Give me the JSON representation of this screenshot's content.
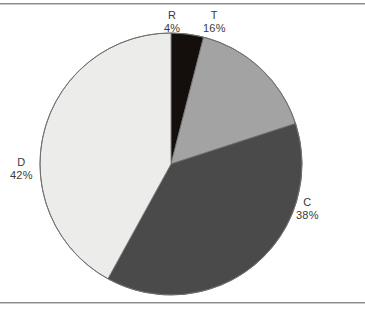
{
  "figure": {
    "name": "pie-chart-figure",
    "width": 365,
    "height": 317,
    "background_color": "#ffffff",
    "rule_color": "#8a8a8a"
  },
  "chart_data": {
    "type": "pie",
    "title": "",
    "subtitle": "",
    "xlabel": "",
    "ylabel": "",
    "legend_position": "none",
    "grid": false,
    "labels_inside": false,
    "label_format": "name_over_percent",
    "start_angle_deg": 0,
    "direction": "clockwise",
    "categories": [
      "R",
      "T",
      "C",
      "D"
    ],
    "values": [
      4,
      16,
      38,
      42
    ],
    "value_labels": [
      "4%",
      "16%",
      "38%",
      "42%"
    ],
    "colors": [
      "#140f0d",
      "#a3a3a3",
      "#4a4a4a",
      "#ececea"
    ],
    "slices": [
      {
        "name": "R",
        "label": "R",
        "percent": 4,
        "percent_label": "4%",
        "color": "#140f0d",
        "start_deg": 0,
        "end_deg": 14.4,
        "label_anchor": "top"
      },
      {
        "name": "T",
        "label": "T",
        "percent": 16,
        "percent_label": "16%",
        "color": "#a3a3a3",
        "start_deg": 14.4,
        "end_deg": 72,
        "label_anchor": "top-right"
      },
      {
        "name": "C",
        "label": "C",
        "percent": 38,
        "percent_label": "38%",
        "color": "#4a4a4a",
        "start_deg": 72,
        "end_deg": 208.8,
        "label_anchor": "right"
      },
      {
        "name": "D",
        "label": "D",
        "percent": 42,
        "percent_label": "42%",
        "color": "#ececea",
        "start_deg": 208.8,
        "end_deg": 360,
        "label_anchor": "left"
      }
    ],
    "geometry": {
      "center_x": 171,
      "center_y": 164,
      "radius": 131,
      "outline_color": "#6f6f6f"
    }
  }
}
